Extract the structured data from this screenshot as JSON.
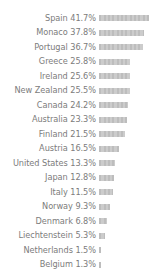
{
  "chart_data": {
    "type": "bar",
    "orientation": "horizontal",
    "title": "",
    "subtitle": "",
    "xlabel": "",
    "ylabel": "",
    "grid": false,
    "legend": false,
    "axis_visible": false,
    "value_suffix": "%",
    "xlim": [
      0,
      41.7
    ],
    "categories": [
      "Spain",
      "Monaco",
      "Portugal",
      "Greece",
      "Ireland",
      "New Zealand",
      "Canada",
      "Australia",
      "Finland",
      "Austria",
      "United States",
      "Japan",
      "Italy",
      "Norway",
      "Denmark",
      "Liechtenstein",
      "Netherlands",
      "Belgium"
    ],
    "values": [
      41.7,
      37.8,
      36.7,
      25.8,
      25.6,
      25.5,
      24.2,
      23.3,
      21.5,
      16.5,
      13.3,
      12.8,
      11.5,
      9.3,
      6.8,
      5.3,
      1.5,
      1.3
    ],
    "labels": [
      "Spain 41.7%",
      "Monaco 37.8%",
      "Portugal 36.7%",
      "Greece 25.8%",
      "Ireland 25.6%",
      "New Zealand 25.5%",
      "Canada 24.2%",
      "Australia 23.3%",
      "Finland 21.5%",
      "Austria 16.5%",
      "United States 13.3%",
      "Japan 12.8%",
      "Italy 11.5%",
      "Norway 9.3%",
      "Denmark 6.8%",
      "Liechtenstein 5.3%",
      "Netherlands 1.5%",
      "Belgium 1.3%"
    ],
    "colors": {
      "bar": "#c2c2c2",
      "bar_stripe": "#bdbdbd",
      "label_text": "#7c7c7c",
      "background": "#ffffff"
    },
    "layout": {
      "label_column_width_px": 98,
      "bar_area_width_px": 50,
      "row_height_px": 14.5,
      "bar_height_px": 6,
      "first_row_top_px": 11
    }
  }
}
